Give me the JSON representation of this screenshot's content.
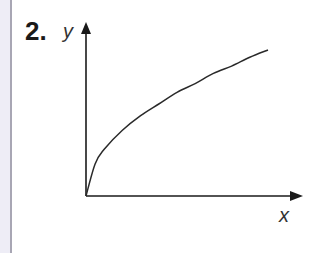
{
  "question": {
    "number": "2."
  },
  "chart_data": {
    "type": "line",
    "title": "",
    "xlabel": "x",
    "ylabel": "y",
    "grid": false,
    "legend": null,
    "series": [
      {
        "name": "curve",
        "x": [
          0,
          0.05,
          0.1,
          0.2,
          0.3,
          0.4,
          0.5,
          0.6,
          0.7,
          0.8,
          0.9,
          1.0
        ],
        "y": [
          0,
          0.22,
          0.32,
          0.45,
          0.55,
          0.63,
          0.71,
          0.77,
          0.84,
          0.89,
          0.95,
          1.0
        ]
      }
    ],
    "xlim": [
      0,
      1.1
    ],
    "ylim": [
      0,
      1.15
    ],
    "axis_arrows": true,
    "tick_labels": []
  },
  "colors": {
    "axis": "#1a1a1a",
    "curve": "#2a2a2a",
    "margin": "#eeedf6",
    "margin_line": "#a8a6b4"
  }
}
